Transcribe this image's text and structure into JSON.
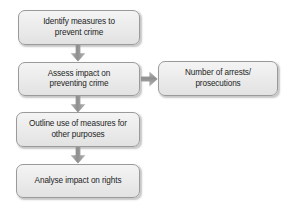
{
  "diagram": {
    "background_color": "#ffffff",
    "node_fill_top": "#f4f4f4",
    "node_fill_bottom": "#e2e2e2",
    "node_border_color": "#9a9a9a",
    "text_color": "#1d1d1d",
    "arrow_color": "#8c8c8c",
    "nodes": [
      {
        "id": "identify",
        "label": "Identify measures to\nprevent crime"
      },
      {
        "id": "assess",
        "label": "Assess impact on\npreventing crime"
      },
      {
        "id": "outline",
        "label": "Outline use of measures for\nother purposes"
      },
      {
        "id": "analyse",
        "label": "Analyse impact on rights"
      },
      {
        "id": "arrests",
        "label": "Number of arrests/\nprosecutions"
      }
    ],
    "connectors": [
      {
        "id": "identify-to-assess",
        "direction": "down",
        "icon": "arrow-down-icon"
      },
      {
        "id": "assess-to-outline",
        "direction": "down",
        "icon": "arrow-down-icon"
      },
      {
        "id": "outline-to-analyse",
        "direction": "down",
        "icon": "arrow-down-icon"
      },
      {
        "id": "assess-to-arrests",
        "direction": "right",
        "icon": "arrow-right-icon"
      }
    ]
  }
}
